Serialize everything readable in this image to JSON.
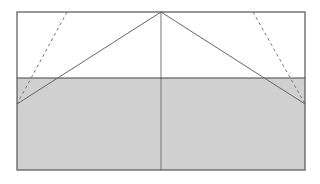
{
  "diagram": {
    "colors": {
      "background": "#ffffff",
      "shaded_fill": "#d0d0d0",
      "outline": "#555555",
      "line": "#666666",
      "dashed": "#777777"
    },
    "rect": {
      "x": 17,
      "y": 12,
      "w": 288,
      "h": 158
    },
    "divider_y": 78,
    "apex": {
      "x": 161,
      "y": 12
    },
    "left_point": {
      "x": 17,
      "y": 104
    },
    "right_point": {
      "x": 305,
      "y": 104
    },
    "dash_left_top": {
      "x": 67,
      "y": 12
    },
    "dash_right_top": {
      "x": 253,
      "y": 12
    }
  }
}
